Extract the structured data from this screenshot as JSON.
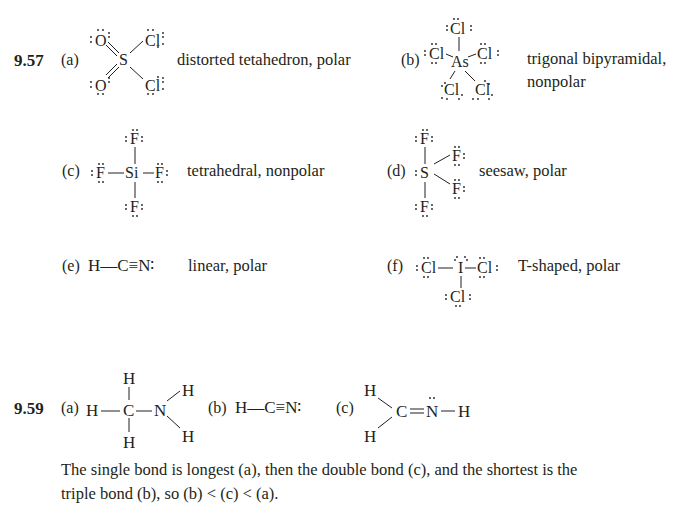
{
  "problem_957": {
    "number": "9.57",
    "parts": [
      {
        "label": "(a)",
        "molecule": "SO2Cl2",
        "description": "distorted tetahedron, polar"
      },
      {
        "label": "(b)",
        "molecule": "AsCl5",
        "description_line1": "trigonal bipyramidal,",
        "description_line2": "nonpolar"
      },
      {
        "label": "(c)",
        "molecule": "SiF4",
        "description": "tetrahedral, nonpolar"
      },
      {
        "label": "(d)",
        "molecule": "SF4",
        "description": "seesaw, polar"
      },
      {
        "label": "(e)",
        "molecule": "HCN",
        "formula": "H—C≡N∶",
        "description": "linear, polar"
      },
      {
        "label": "(f)",
        "molecule": "ICl3",
        "description": "T-shaped, polar"
      }
    ]
  },
  "problem_959": {
    "number": "9.59",
    "parts": [
      {
        "label": "(a)",
        "molecule": "CH3NH2"
      },
      {
        "label": "(b)",
        "molecule": "HCN",
        "formula": "H—C≡N∶"
      },
      {
        "label": "(c)",
        "molecule": "CH2NH"
      }
    ],
    "explanation_line1": "The single bond is longest (a), then the double bond (c), and the shortest is the",
    "explanation_line2": "triple bond (b), so (b) < (c) < (a)."
  },
  "atoms": {
    "S": "S",
    "O": "O",
    "Cl": "Cl",
    "As": "As",
    "Si": "Si",
    "F": "F",
    "H": "H",
    "C": "C",
    "N": "N",
    "I": "I"
  }
}
